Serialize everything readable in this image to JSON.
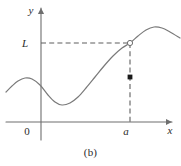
{
  "figure": {
    "caption": "(b)",
    "caption_y": 146,
    "background": "#ffffff",
    "axis_color": "#6e6e6e",
    "curve_color": "#7a7a7a",
    "dash_color": "#5f5f5f",
    "text_color": "#2b2b2b",
    "marker_open_fill": "#ffffff",
    "marker_closed_fill": "#1a1a1a"
  },
  "axes": {
    "x_label": "x",
    "y_label": "y",
    "origin_label": "0",
    "x_axis_y": 122,
    "y_axis_x": 41,
    "x_axis_start": 6,
    "x_axis_end": 172,
    "y_axis_top": 8,
    "y_axis_bottom": 140,
    "x_label_pos": {
      "x": 170,
      "y": 134
    },
    "y_label_pos": {
      "x": 31,
      "y": 14
    },
    "origin_label_pos": {
      "x": 27,
      "y": 135
    }
  },
  "markers": {
    "limit_label": "L",
    "limit_label_pos": {
      "x": 25,
      "y": 47
    },
    "limit_value_y": 43,
    "point_label": "a",
    "point_label_pos": {
      "x": 126,
      "y": 135
    },
    "point_value_x": 130,
    "open_circle": {
      "x": 130,
      "y": 43,
      "r": 2.6
    },
    "closed_dot": {
      "x": 130,
      "y": 77,
      "r": 2.4
    }
  },
  "dashed_lines": [
    {
      "name": "horizontal-limit-line",
      "x1": 41,
      "y1": 43,
      "x2": 130,
      "y2": 43
    },
    {
      "name": "vertical-point-line",
      "x1": 130,
      "y1": 43,
      "x2": 130,
      "y2": 122
    }
  ],
  "chart_data": {
    "type": "line",
    "title": "(b)",
    "xlabel": "x",
    "ylabel": "y",
    "annotations": [
      "L",
      "a",
      "0"
    ],
    "curve_points_px": [
      [
        6,
        92
      ],
      [
        12,
        86
      ],
      [
        18,
        81
      ],
      [
        25,
        78
      ],
      [
        32,
        79
      ],
      [
        40,
        85
      ],
      [
        48,
        95
      ],
      [
        55,
        102
      ],
      [
        62,
        105
      ],
      [
        70,
        103
      ],
      [
        78,
        97
      ],
      [
        86,
        88
      ],
      [
        95,
        77
      ],
      [
        104,
        66
      ],
      [
        113,
        56
      ],
      [
        122,
        48
      ],
      [
        130,
        43
      ],
      [
        138,
        36
      ],
      [
        146,
        30
      ],
      [
        154,
        27
      ],
      [
        162,
        28
      ],
      [
        170,
        32
      ],
      [
        180,
        38
      ]
    ],
    "grid": false,
    "legend": null
  }
}
